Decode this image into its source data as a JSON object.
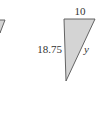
{
  "figure": {
    "triangle": {
      "fill": "#d4d4d4",
      "stroke": "#555555",
      "labels": {
        "top": "10",
        "left": "18.75",
        "hypotenuse": "y"
      }
    },
    "left_fragment": {
      "fill": "#d4d4d4",
      "stroke": "#555555"
    }
  }
}
